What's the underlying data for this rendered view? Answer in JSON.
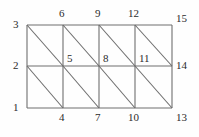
{
  "figure": {
    "kind": "finite-element-mesh-diagram",
    "background_color": "#fefefe",
    "line_color": "#6e6e6e",
    "label_color": "#2b2b2b",
    "grid": {
      "columns": 4,
      "rows": 2,
      "cell_diagonal_direction": "top-left-to-bottom-right",
      "x_positions": [
        27,
        63,
        99,
        135,
        172
      ],
      "y_positions": [
        25,
        66,
        108
      ]
    }
  },
  "labels": [
    {
      "text": "3",
      "x": 13,
      "y": 19,
      "anchor": "left-top-corner"
    },
    {
      "text": "2",
      "x": 13,
      "y": 60,
      "anchor": "left-mid"
    },
    {
      "text": "1",
      "x": 13,
      "y": 102,
      "anchor": "left-bottom-corner"
    },
    {
      "text": "6",
      "x": 59,
      "y": 8,
      "anchor": "top-node-2"
    },
    {
      "text": "9",
      "x": 95,
      "y": 8,
      "anchor": "top-node-3"
    },
    {
      "text": "12",
      "x": 128,
      "y": 8,
      "anchor": "top-node-4"
    },
    {
      "text": "15",
      "x": 176,
      "y": 13,
      "anchor": "top-right-corner"
    },
    {
      "text": "5",
      "x": 67,
      "y": 53,
      "anchor": "interior-node-2"
    },
    {
      "text": "8",
      "x": 103,
      "y": 53,
      "anchor": "interior-node-3"
    },
    {
      "text": "11",
      "x": 139,
      "y": 53,
      "anchor": "interior-node-4"
    },
    {
      "text": "14",
      "x": 176,
      "y": 60,
      "anchor": "right-mid"
    },
    {
      "text": "4",
      "x": 59,
      "y": 112,
      "anchor": "bottom-node-2"
    },
    {
      "text": "7",
      "x": 95,
      "y": 112,
      "anchor": "bottom-node-3"
    },
    {
      "text": "10",
      "x": 128,
      "y": 112,
      "anchor": "bottom-node-4"
    },
    {
      "text": "13",
      "x": 176,
      "y": 112,
      "anchor": "bottom-right-corner"
    }
  ]
}
